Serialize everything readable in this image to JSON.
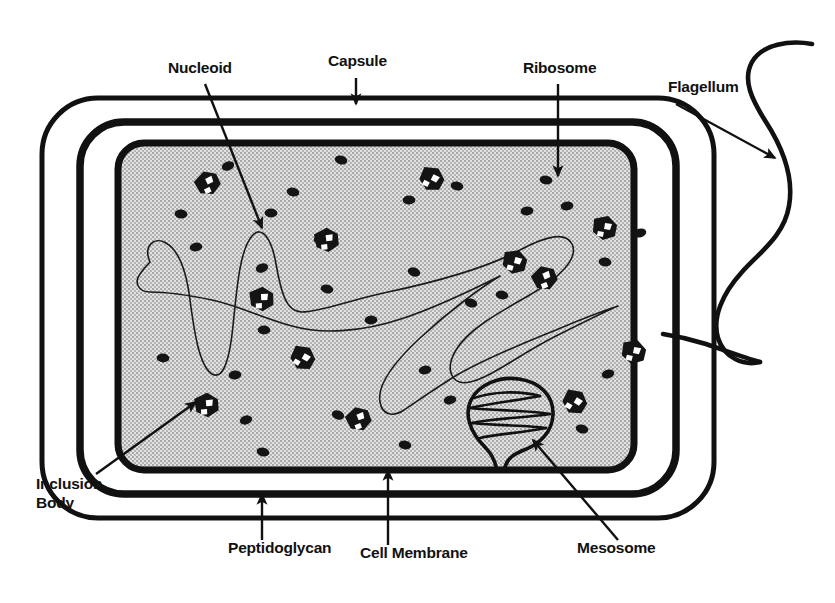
{
  "figure": {
    "type": "labeled-biological-diagram",
    "background_color": "#ffffff",
    "ink_color": "#111111",
    "cytoplasm_color": "#c9c9c9"
  },
  "labels": {
    "nucleoid": "Nucleoid",
    "capsule": "Capsule",
    "ribosome": "Ribosome",
    "flagellum": "Flagellum",
    "inclusion_body_line1": "Inclusion",
    "inclusion_body_line2": "Body",
    "peptidoglycan": "Peptidoglycan",
    "cell_membrane": "Cell Membrane",
    "mesosome": "Mesosome"
  },
  "structures": {
    "capsule": {
      "name": "Capsule",
      "description": "Outermost thin rounded-rectangle envelope",
      "stroke_width": 5
    },
    "peptidoglycan": {
      "name": "Peptidoglycan",
      "description": "Thick middle cell-wall layer",
      "stroke_width": 7
    },
    "cell_membrane": {
      "name": "Cell Membrane",
      "description": "Innermost thick boundary enclosing cytoplasm",
      "stroke_width": 7
    },
    "cytoplasm": {
      "name": "Cytoplasm",
      "description": "Stippled gray interior fill"
    },
    "nucleoid": {
      "name": "Nucleoid",
      "description": "Single continuous looping DNA strand, thin line"
    },
    "mesosome": {
      "name": "Mesosome",
      "description": "Balloon-shaped infolding of cell membrane with internal folded lamellae, attached by a narrow neck to the membrane"
    },
    "flagellum": {
      "name": "Flagellum",
      "description": "Long wavy S-shaped filament emerging from the right side of the cell"
    },
    "ribosome": {
      "name": "Ribosome",
      "description": "Small solid dark ellipse scattered through the cytoplasm",
      "count": 31
    },
    "inclusion_body": {
      "name": "Inclusion Body",
      "description": "Angular dark polygonal granule with white internal notches",
      "count": 12
    }
  },
  "ribosomes": [
    [
      228,
      166
    ],
    [
      341,
      160
    ],
    [
      293,
      192
    ],
    [
      457,
      186
    ],
    [
      546,
      180
    ],
    [
      181,
      214
    ],
    [
      271,
      213
    ],
    [
      409,
      200
    ],
    [
      527,
      211
    ],
    [
      567,
      206
    ],
    [
      196,
      247
    ],
    [
      320,
      239
    ],
    [
      640,
      233
    ],
    [
      262,
      268
    ],
    [
      414,
      272
    ],
    [
      471,
      303
    ],
    [
      327,
      289
    ],
    [
      502,
      295
    ],
    [
      605,
      262
    ],
    [
      163,
      358
    ],
    [
      264,
      330
    ],
    [
      371,
      320
    ],
    [
      235,
      375
    ],
    [
      425,
      370
    ],
    [
      450,
      400
    ],
    [
      608,
      374
    ],
    [
      246,
      420
    ],
    [
      338,
      415
    ],
    [
      582,
      429
    ],
    [
      263,
      452
    ],
    [
      405,
      445
    ]
  ],
  "inclusion_bodies": [
    [
      208,
      183
    ],
    [
      432,
      179
    ],
    [
      605,
      228
    ],
    [
      327,
      240
    ],
    [
      545,
      278
    ],
    [
      303,
      358
    ],
    [
      634,
      352
    ],
    [
      207,
      405
    ],
    [
      359,
      419
    ],
    [
      575,
      402
    ],
    [
      515,
      262
    ],
    [
      262,
      299
    ]
  ],
  "annotations": [
    {
      "id": "nucleoid",
      "label": "Nucleoid",
      "text_x": 168,
      "text_y": 73,
      "leader": "line-down-right",
      "arrow": true
    },
    {
      "id": "capsule",
      "label": "Capsule",
      "text_x": 328,
      "text_y": 66,
      "leader": "line-down",
      "arrow": true
    },
    {
      "id": "ribosome",
      "label": "Ribosome",
      "text_x": 523,
      "text_y": 73,
      "leader": "line-down",
      "arrow": true
    },
    {
      "id": "flagellum",
      "label": "Flagellum",
      "text_x": 668,
      "text_y": 92,
      "leader": "line-down-right",
      "arrow": true
    },
    {
      "id": "inclusion",
      "label": "Inclusion Body",
      "text_x": 36,
      "text_y": 489,
      "leader": "line-up-right",
      "arrow": true
    },
    {
      "id": "peptidoglycan",
      "label": "Peptidoglycan",
      "text_x": 228,
      "text_y": 553,
      "leader": "line-up",
      "arrow": true
    },
    {
      "id": "membrane",
      "label": "Cell Membrane",
      "text_x": 360,
      "text_y": 558,
      "leader": "line-up",
      "arrow": true
    },
    {
      "id": "mesosome",
      "label": "Mesosome",
      "text_x": 577,
      "text_y": 553,
      "leader": "line-up-left",
      "arrow": true
    }
  ]
}
